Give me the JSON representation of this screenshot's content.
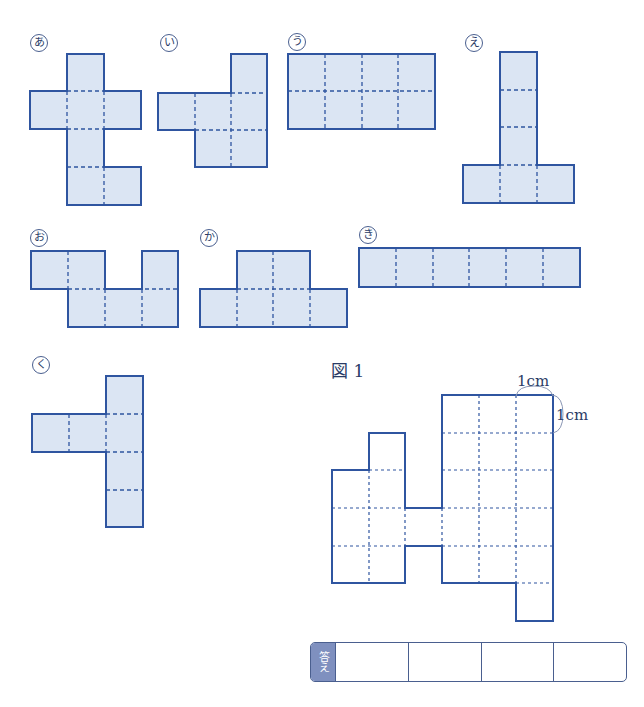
{
  "colors": {
    "stroke": "#2f55a0",
    "fill": "#dbe5f3",
    "label": "#2a3b66"
  },
  "nets": [
    {
      "id": "a",
      "label": "あ",
      "label_pos": [
        30,
        34
      ]
    },
    {
      "id": "i",
      "label": "い",
      "label_pos": [
        160,
        34
      ]
    },
    {
      "id": "u",
      "label": "う",
      "label_pos": [
        288,
        33
      ]
    },
    {
      "id": "e",
      "label": "え",
      "label_pos": [
        465,
        34
      ]
    },
    {
      "id": "o",
      "label": "お",
      "label_pos": [
        30,
        229
      ]
    },
    {
      "id": "ka",
      "label": "か",
      "label_pos": [
        200,
        229
      ]
    },
    {
      "id": "ki",
      "label": "き",
      "label_pos": [
        359,
        226
      ]
    },
    {
      "id": "ku",
      "label": "く",
      "label_pos": [
        32,
        356
      ]
    }
  ],
  "figure1": {
    "title": "図 1",
    "unit_top": "1cm",
    "unit_side": "1cm"
  },
  "answer": {
    "tag": "答え",
    "cells": [
      "",
      "",
      "",
      ""
    ]
  }
}
